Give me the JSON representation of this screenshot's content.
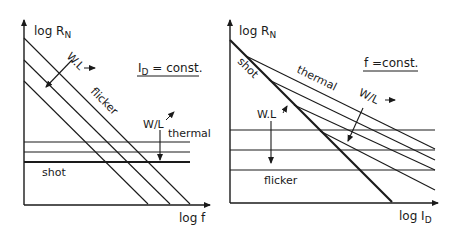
{
  "left": {
    "y_label": "log R",
    "y_label_sub": "N",
    "x_label": "log f",
    "condition_pre": "I",
    "condition_sub": "D",
    "condition_post": " = const.",
    "flicker_label": "flicker",
    "thermal_label": "thermal",
    "shot_label": "shot",
    "wl_product_label": "W.L",
    "wl_ratio_label": "W/L"
  },
  "right": {
    "y_label": "log R",
    "y_label_sub": "N",
    "x_label_pre": "log I",
    "x_label_sub": "D",
    "condition": "f =const.",
    "shot_label": "shot",
    "thermal_label": "thermal",
    "flicker_label": "flicker",
    "wl_ratio_label": "W/L",
    "wl_product_label": "W.L"
  },
  "colors": {
    "ink": "#1a1a1a",
    "background": "#ffffff"
  }
}
